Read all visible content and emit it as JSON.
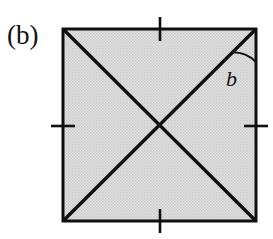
{
  "figure": {
    "panel_label": "(b)",
    "caption_label": "(b)",
    "type": "geometric-diagram",
    "angle_label": "b",
    "background_color": "#ffffff",
    "shape": {
      "name": "square",
      "fill_color": "#d9d9d9",
      "stroke_color": "#101010",
      "stroke_width": 3,
      "left": 63,
      "top": 29,
      "right": 256,
      "bottom": 221,
      "width": 193,
      "height": 192
    },
    "diagonals": [
      {
        "name": "diagonal-top-left-to-bottom-right",
        "from": "top-left",
        "to": "bottom-right",
        "stroke_color": "#101010",
        "stroke_width": 3.4
      },
      {
        "name": "diagonal-bottom-left-to-top-right",
        "from": "bottom-left",
        "to": "top-right",
        "stroke_color": "#101010",
        "stroke_width": 3.4
      }
    ],
    "tick_marks": [
      {
        "name": "tick-top",
        "side": "top",
        "x": 160,
        "y": 29,
        "length": 24,
        "orientation": "vertical"
      },
      {
        "name": "tick-bottom",
        "side": "bottom",
        "x": 160,
        "y": 221,
        "length": 24,
        "orientation": "vertical"
      },
      {
        "name": "tick-left",
        "side": "left",
        "x": 63,
        "y": 126,
        "length": 24,
        "orientation": "horizontal"
      },
      {
        "name": "tick-right",
        "side": "right",
        "x": 256,
        "y": 126,
        "length": 24,
        "orientation": "horizontal"
      }
    ],
    "angle_marker": {
      "name": "angle-arc-b",
      "vertex": "top-right-corner",
      "vertex_x": 256,
      "vertex_y": 29,
      "radius": 33,
      "between": [
        "diagonal-bottom-left-to-top-right",
        "right-edge"
      ],
      "stroke_color": "#101010",
      "stroke_width": 2,
      "label": "b",
      "label_x": 226,
      "label_y": 86
    }
  }
}
